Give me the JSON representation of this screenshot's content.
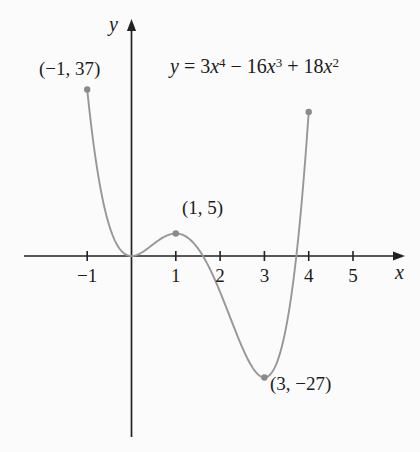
{
  "figure": {
    "y_axis_label": "y",
    "x_axis_label": "x",
    "equation_text": "y = 3x⁴ − 16x³ + 18x²",
    "equation": {
      "lhs": "y",
      "eq": " = ",
      "c1": "3",
      "v1": "x",
      "e1": "4",
      "op1": " − ",
      "c2": "16",
      "v2": "x",
      "e2": "3",
      "op2": " + ",
      "c3": "18",
      "v3": "x",
      "e3": "2"
    }
  },
  "chart_data": {
    "type": "line",
    "xlabel": "x",
    "ylabel": "y",
    "xlim": [
      -2.25,
      6.15
    ],
    "ylim": [
      -40,
      52
    ],
    "grid": false,
    "legend": false,
    "function": {
      "expression": "y = 3x^4 - 16x^3 + 18x^2",
      "coeffs_desc": [
        3,
        -16,
        18,
        0,
        0
      ],
      "domain": [
        -1,
        4
      ]
    },
    "x_ticks": [
      {
        "value": -1,
        "label": "−1"
      },
      {
        "value": 1,
        "label": "1"
      },
      {
        "value": 2,
        "label": "2"
      },
      {
        "value": 3,
        "label": "3"
      },
      {
        "value": 4,
        "label": "4"
      },
      {
        "value": 5,
        "label": "5"
      }
    ],
    "points": [
      {
        "x": -1,
        "y": 37,
        "label": "(−1, 37)"
      },
      {
        "x": 1,
        "y": 5,
        "label": "(1, 5)"
      },
      {
        "x": 3,
        "y": -27,
        "label": "(3, −27)"
      },
      {
        "x": 4,
        "y": 32,
        "label": ""
      }
    ],
    "colors": {
      "curve": "#979797",
      "point": "#8a8a8a",
      "axis": "#222222",
      "text": "#1b1b1b",
      "background": "#fbfbfb"
    }
  }
}
